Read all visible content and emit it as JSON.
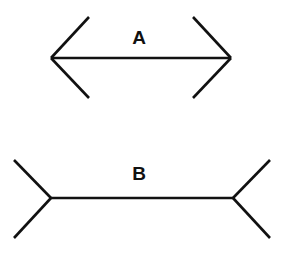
{
  "figure": {
    "background": "#ffffff",
    "stroke_color": "#111111"
  },
  "figures": [
    {
      "label": "A",
      "style": "arrowheads-inward",
      "shaft": {
        "x1": 51,
        "y1": 58,
        "x2": 231,
        "y2": 58
      },
      "fins": [
        {
          "x1": 51,
          "y1": 58,
          "x2": 89,
          "y2": 17
        },
        {
          "x1": 51,
          "y1": 58,
          "x2": 89,
          "y2": 98
        },
        {
          "x1": 231,
          "y1": 58,
          "x2": 193,
          "y2": 17
        },
        {
          "x1": 231,
          "y1": 58,
          "x2": 193,
          "y2": 98
        }
      ],
      "label_pos": {
        "x": 139,
        "y": 44
      }
    },
    {
      "label": "B",
      "style": "fins-outward",
      "shaft": {
        "x1": 51,
        "y1": 198,
        "x2": 233,
        "y2": 198
      },
      "fins": [
        {
          "x1": 51,
          "y1": 198,
          "x2": 14,
          "y2": 160
        },
        {
          "x1": 51,
          "y1": 198,
          "x2": 14,
          "y2": 238
        },
        {
          "x1": 233,
          "y1": 198,
          "x2": 270,
          "y2": 160
        },
        {
          "x1": 233,
          "y1": 198,
          "x2": 270,
          "y2": 238
        }
      ],
      "label_pos": {
        "x": 139,
        "y": 180
      }
    }
  ]
}
